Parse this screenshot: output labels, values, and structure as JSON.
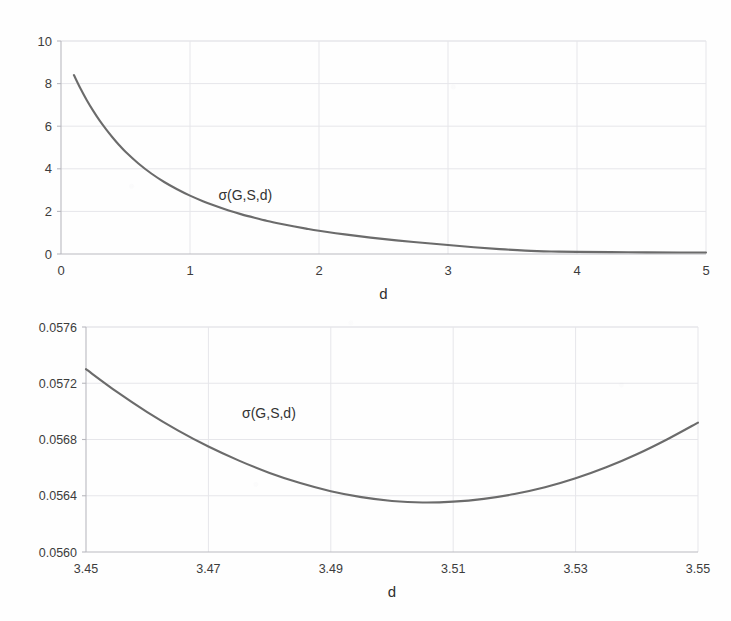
{
  "figure": {
    "background_color": "#fefefe",
    "curve_color": "#6b6b6b",
    "grid_color": "#e6e6ea",
    "axis_color": "#b9b9bf",
    "text_color": "#3c3c3c"
  },
  "chart_data": [
    {
      "id": "top",
      "type": "line",
      "title": "",
      "xlabel": "d",
      "ylabel": "",
      "xlim": [
        0,
        5
      ],
      "ylim": [
        0,
        10
      ],
      "xticks": [
        "0",
        "1",
        "2",
        "3",
        "4",
        "5"
      ],
      "xtick_values": [
        0,
        1,
        2,
        3,
        4,
        5
      ],
      "yticks": [
        "0",
        "2",
        "4",
        "6",
        "8",
        "10"
      ],
      "ytick_values": [
        0,
        2,
        4,
        6,
        8,
        10
      ],
      "grid": true,
      "legend_position": "inline-annotation",
      "annotations": [
        {
          "text": "σ(G,S,d)",
          "x": 1.22,
          "y": 2.55
        }
      ],
      "series": [
        {
          "name": "σ(G,S,d)",
          "color": "#6b6b6b",
          "x": [
            0.1,
            0.15,
            0.2,
            0.25,
            0.3,
            0.35,
            0.4,
            0.45,
            0.5,
            0.6,
            0.7,
            0.8,
            0.9,
            1.0,
            1.1,
            1.2,
            1.3,
            1.4,
            1.5,
            1.6,
            1.7,
            1.8,
            1.9,
            2.0,
            2.2,
            2.4,
            2.6,
            2.8,
            3.0,
            3.2,
            3.4,
            3.6,
            3.8,
            4.0,
            4.4,
            4.8,
            5.0
          ],
          "y": [
            8.4,
            7.78,
            7.22,
            6.72,
            6.26,
            5.85,
            5.47,
            5.12,
            4.8,
            4.25,
            3.78,
            3.38,
            3.04,
            2.74,
            2.48,
            2.25,
            2.04,
            1.86,
            1.7,
            1.55,
            1.42,
            1.3,
            1.19,
            1.09,
            0.92,
            0.77,
            0.64,
            0.53,
            0.42,
            0.32,
            0.23,
            0.16,
            0.12,
            0.1,
            0.08,
            0.07,
            0.07
          ]
        }
      ]
    },
    {
      "id": "bottom",
      "type": "line",
      "title": "",
      "xlabel": "d",
      "ylabel": "",
      "xlim": [
        3.45,
        3.55
      ],
      "ylim": [
        0.056,
        0.0576
      ],
      "xticks": [
        "3.45",
        "3.47",
        "3.49",
        "3.51",
        "3.53",
        "3.55"
      ],
      "xtick_values": [
        3.45,
        3.47,
        3.49,
        3.51,
        3.53,
        3.55
      ],
      "yticks": [
        "0.0560",
        "0.0564",
        "0.0568",
        "0.0572",
        "0.0576"
      ],
      "ytick_values": [
        0.056,
        0.0564,
        0.0568,
        0.0572,
        0.0576
      ],
      "grid": true,
      "legend_position": "inline-annotation",
      "annotations": [
        {
          "text": "σ(G,S,d)",
          "x": 3.4755,
          "y": 0.05695
        }
      ],
      "series": [
        {
          "name": "σ(G,S,d)",
          "color": "#6b6b6b",
          "x": [
            3.45,
            3.455,
            3.46,
            3.465,
            3.47,
            3.475,
            3.48,
            3.485,
            3.49,
            3.495,
            3.5,
            3.505,
            3.51,
            3.515,
            3.52,
            3.525,
            3.53,
            3.535,
            3.54,
            3.545,
            3.55
          ],
          "y": [
            0.0573,
            0.05714,
            0.056995,
            0.056865,
            0.05675,
            0.05665,
            0.056562,
            0.05649,
            0.056432,
            0.05639,
            0.056363,
            0.056352,
            0.056358,
            0.056378,
            0.056412,
            0.05646,
            0.056524,
            0.056602,
            0.056695,
            0.056802,
            0.05692
          ]
        }
      ],
      "minimum": {
        "d": 3.5045,
        "sigma": 0.056351
      }
    }
  ]
}
